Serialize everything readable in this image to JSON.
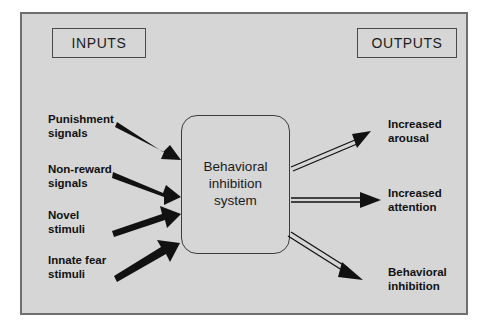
{
  "diagram": {
    "title_boxes": {
      "inputs": "INPUTS",
      "outputs": "OUTPUTS"
    },
    "center": {
      "label": "Behavioral\ninhibition\nsystem"
    },
    "inputs": [
      {
        "label": "Punishment\nsignals"
      },
      {
        "label": "Non-reward\nsignals"
      },
      {
        "label": "Novel\nstimuli"
      },
      {
        "label": "Innate fear\nstimuli"
      }
    ],
    "outputs": [
      {
        "label": "Increased\narousal"
      },
      {
        "label": "Increased\nattention"
      },
      {
        "label": "Behavioral\ninhibition"
      }
    ],
    "colors": {
      "background": "#d6d6d6",
      "page": "#ffffff",
      "frame_border": "#6f6f6f",
      "box_border": "#3c3c3c",
      "arrow_solid": "#111111",
      "text": "#111111"
    }
  }
}
